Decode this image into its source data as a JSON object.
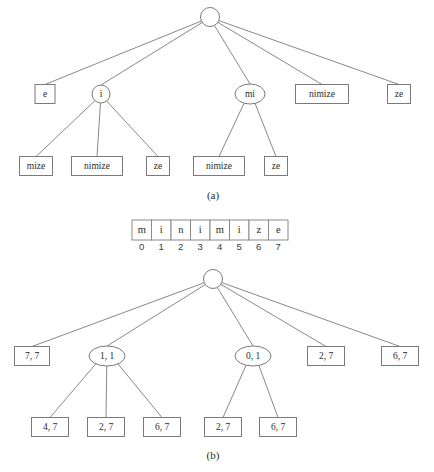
{
  "figure": {
    "captions": [
      {
        "label": "(a)",
        "x": 213,
        "y": 196
      },
      {
        "label": "(b)",
        "x": 213,
        "y": 456
      }
    ],
    "panel_a": {
      "root": {
        "name": "root-a",
        "shape": "circle",
        "cx": 210,
        "cy": 17,
        "rx": 9.5,
        "ry": 9.5,
        "label": ""
      },
      "level2": [
        {
          "name": "node-a-e",
          "shape": "rect",
          "cx": 45,
          "cy": 94,
          "w": 20,
          "h": 19,
          "label": "e"
        },
        {
          "name": "node-a-i",
          "shape": "circle",
          "cx": 101,
          "cy": 94,
          "rx": 9,
          "ry": 9,
          "label": "i"
        },
        {
          "name": "node-a-mi",
          "shape": "ellipse",
          "cx": 250,
          "cy": 94,
          "rx": 15,
          "ry": 10,
          "label": "mi"
        },
        {
          "name": "node-a-nimize",
          "shape": "rect",
          "cx": 322,
          "cy": 94,
          "w": 53,
          "h": 19,
          "label": "nimize"
        },
        {
          "name": "node-a-ze",
          "shape": "rect",
          "cx": 399,
          "cy": 94,
          "w": 23,
          "h": 19,
          "label": "ze"
        }
      ],
      "level3_i": [
        {
          "name": "node-a-mize",
          "shape": "rect",
          "cx": 36,
          "cy": 166,
          "w": 33,
          "h": 19,
          "label": "mize"
        },
        {
          "name": "node-a-nimize-2",
          "shape": "rect",
          "cx": 97,
          "cy": 166,
          "w": 51,
          "h": 19,
          "label": "nimize"
        },
        {
          "name": "node-a-ze-2",
          "shape": "rect",
          "cx": 158,
          "cy": 166,
          "w": 23,
          "h": 19,
          "label": "ze"
        }
      ],
      "level3_mi": [
        {
          "name": "node-a-nimize-3",
          "shape": "rect",
          "cx": 219,
          "cy": 166,
          "w": 51,
          "h": 19,
          "label": "nimize"
        },
        {
          "name": "node-a-ze-3",
          "shape": "rect",
          "cx": 276,
          "cy": 166,
          "w": 23,
          "h": 19,
          "label": "ze"
        }
      ]
    },
    "array": {
      "name": "character-array",
      "x": 132,
      "y": 220,
      "cell_w": 19.5,
      "cell_h": 20,
      "chars": [
        "m",
        "i",
        "n",
        "i",
        "m",
        "i",
        "z",
        "e"
      ],
      "indices": [
        "0",
        "1",
        "2",
        "3",
        "4",
        "5",
        "6",
        "7"
      ],
      "index_y": 247
    },
    "panel_b": {
      "root": {
        "name": "root-b",
        "shape": "circle",
        "cx": 213,
        "cy": 279,
        "rx": 9.5,
        "ry": 9.5,
        "label": ""
      },
      "level2": [
        {
          "name": "node-b-7-7",
          "shape": "rect",
          "cx": 32,
          "cy": 356,
          "w": 35,
          "h": 19,
          "label": "7, 7"
        },
        {
          "name": "node-b-1-1",
          "shape": "ellipse",
          "cx": 107,
          "cy": 356,
          "rx": 18,
          "ry": 10,
          "label": "1, 1"
        },
        {
          "name": "node-b-0-1",
          "shape": "ellipse",
          "cx": 253,
          "cy": 356,
          "rx": 18,
          "ry": 10,
          "label": "0, 1"
        },
        {
          "name": "node-b-2-7",
          "shape": "rect",
          "cx": 326,
          "cy": 356,
          "w": 37,
          "h": 19,
          "label": "2, 7"
        },
        {
          "name": "node-b-6-7",
          "shape": "rect",
          "cx": 400,
          "cy": 356,
          "w": 37,
          "h": 19,
          "label": "6, 7"
        }
      ],
      "level3_left": [
        {
          "name": "node-b-4-7",
          "shape": "rect",
          "cx": 50,
          "cy": 427,
          "w": 37,
          "h": 19,
          "label": "4, 7"
        },
        {
          "name": "node-b-2-7-2",
          "shape": "rect",
          "cx": 106,
          "cy": 427,
          "w": 37,
          "h": 19,
          "label": "2, 7"
        },
        {
          "name": "node-b-6-7-2",
          "shape": "rect",
          "cx": 162,
          "cy": 427,
          "w": 37,
          "h": 19,
          "label": "6, 7"
        }
      ],
      "level3_right": [
        {
          "name": "node-b-2-7-3",
          "shape": "rect",
          "cx": 223,
          "cy": 427,
          "w": 37,
          "h": 19,
          "label": "2, 7"
        },
        {
          "name": "node-b-6-7-3",
          "shape": "rect",
          "cx": 278,
          "cy": 427,
          "w": 37,
          "h": 19,
          "label": "6, 7"
        }
      ]
    },
    "colors": {
      "stroke": "#7a7a7a",
      "text": "#2b2b2b",
      "background": "#ffffff"
    }
  }
}
